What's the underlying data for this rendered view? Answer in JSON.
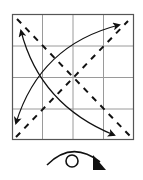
{
  "diagram": {
    "type": "origami-step",
    "paper": {
      "x": 12,
      "y": 14,
      "size": 122,
      "grid_divisions": 4,
      "border_color": "#555555",
      "grid_color": "#999999"
    },
    "crease_lines": [
      {
        "name": "diagonal-valley-tl-br",
        "from": [
          17,
          19
        ],
        "to": [
          130,
          136
        ],
        "style": "dashed"
      },
      {
        "name": "diagonal-valley-bl-tr",
        "from": [
          16,
          137
        ],
        "to": [
          128,
          21
        ],
        "style": "dashed"
      }
    ],
    "fold_arrows": [
      {
        "name": "arrow-tl-to-br",
        "style": "double-headed"
      },
      {
        "name": "arrow-bl-to-tr",
        "style": "double-headed"
      }
    ],
    "symbol": {
      "name": "turn-over",
      "meaning": "Turn the model over"
    },
    "line_color": "#111111"
  }
}
